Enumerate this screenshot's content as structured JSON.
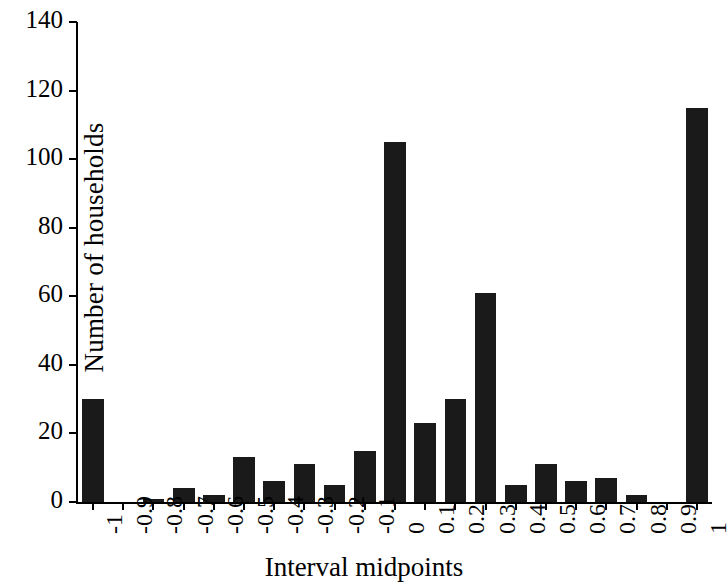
{
  "chart_data": {
    "type": "bar",
    "title": "",
    "xlabel": "Interval midpoints",
    "ylabel": "Number of households",
    "categories": [
      "-1",
      "-0.9",
      "-0.8",
      "-0.7",
      "-0.6",
      "-0.5",
      "-0.4",
      "-0.3",
      "-0.2",
      "-0.1",
      "0",
      "0.1",
      "0.2",
      "0.3",
      "0.4",
      "0.5",
      "0.6",
      "0.7",
      "0.8",
      "0.9",
      "1"
    ],
    "values": [
      30,
      0,
      1,
      4,
      2,
      13,
      6,
      11,
      5,
      15,
      105,
      23,
      30,
      61,
      5,
      11,
      6,
      7,
      2,
      0,
      115
    ],
    "ylim": [
      0,
      140
    ],
    "yticks": [
      0,
      20,
      40,
      60,
      80,
      100,
      120,
      140
    ],
    "ytick_labels": [
      "0",
      "20",
      "40",
      "60",
      "80",
      "100",
      "120",
      "140"
    ],
    "grid": false,
    "legend": false,
    "bar_color": "#1a1a1a",
    "axis_color": "#000000"
  }
}
